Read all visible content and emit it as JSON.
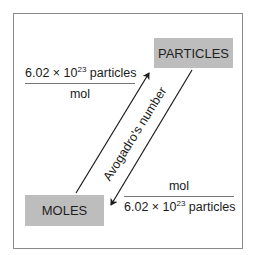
{
  "diagram": {
    "nodes": {
      "particles": {
        "label": "PARTICLES"
      },
      "moles": {
        "label": "MOLES"
      }
    },
    "conversion_to_particles": {
      "numerator_prefix": "6.02 × 10",
      "numerator_exponent": "23",
      "numerator_suffix": " particles",
      "denominator": "mol"
    },
    "conversion_to_moles": {
      "numerator": "mol",
      "denominator_prefix": "6.02 × 10",
      "denominator_exponent": "23",
      "denominator_suffix": " particles"
    },
    "arrow_label": "Avogadro's number",
    "colors": {
      "node_fill": "#bdbdbd",
      "frame_border": "#8a8a8a",
      "arrow": "#1a1a1a"
    }
  }
}
